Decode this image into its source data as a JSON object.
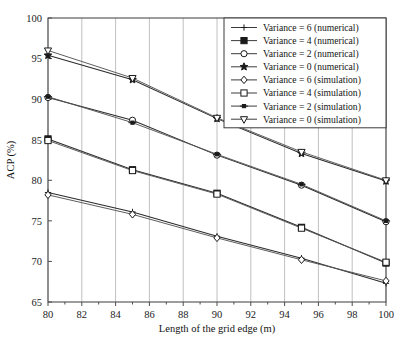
{
  "chart_data": {
    "type": "line",
    "title": "",
    "xlabel": "Length of the grid edge (m)",
    "ylabel": "ACP (%)",
    "xlim": [
      80,
      100
    ],
    "ylim": [
      65,
      100
    ],
    "xticks": [
      80,
      82,
      84,
      86,
      88,
      90,
      92,
      94,
      96,
      98,
      100
    ],
    "yticks": [
      65,
      70,
      75,
      80,
      85,
      90,
      95,
      100
    ],
    "grid": "vertical",
    "legend_position": "top-right",
    "x": [
      80,
      85,
      90,
      95,
      100
    ],
    "series": [
      {
        "name": "Variance = 6 (numerical)",
        "marker": "plus",
        "style": "solid",
        "values": [
          78.5,
          76.1,
          73.1,
          70.4,
          67.3
        ]
      },
      {
        "name": "Variance = 4 (numerical)",
        "marker": "square-solid",
        "style": "solid",
        "values": [
          85.1,
          81.3,
          78.4,
          74.2,
          69.8
        ]
      },
      {
        "name": "Variance = 2 (numerical)",
        "marker": "circle-open",
        "style": "solid",
        "values": [
          90.2,
          87.4,
          83.1,
          79.4,
          74.9
        ]
      },
      {
        "name": "Variance = 0 (numerical)",
        "marker": "star-solid",
        "style": "solid",
        "values": [
          95.4,
          92.4,
          87.6,
          83.3,
          79.9
        ]
      },
      {
        "name": "Variance = 6 (simulation)",
        "marker": "diamond-open",
        "style": "solid",
        "values": [
          78.2,
          75.8,
          72.9,
          70.2,
          67.6
        ]
      },
      {
        "name": "Variance = 4 (simulation)",
        "marker": "square-open",
        "style": "solid",
        "values": [
          84.9,
          81.2,
          78.3,
          74.1,
          69.9
        ]
      },
      {
        "name": "Variance = 2 (simulation)",
        "marker": "plus-solid",
        "style": "solid",
        "values": [
          90.3,
          87.1,
          83.2,
          79.5,
          75.0
        ]
      },
      {
        "name": "Variance = 0 (simulation)",
        "marker": "triangle-down-open",
        "style": "solid",
        "values": [
          96.0,
          92.6,
          87.7,
          83.5,
          80.0
        ]
      }
    ]
  },
  "axis": {
    "ylabel": "ACP (%)",
    "xlabel": "Length of the grid edge (m)",
    "xticklabels": [
      "80",
      "82",
      "84",
      "86",
      "88",
      "90",
      "92",
      "94",
      "96",
      "98",
      "100"
    ],
    "yticklabels": [
      "65",
      "70",
      "75",
      "80",
      "85",
      "90",
      "95",
      "100"
    ]
  },
  "legend": {
    "items": [
      {
        "label": "Variance = 6 (numerical)",
        "marker": "plus"
      },
      {
        "label": "Variance = 4 (numerical)",
        "marker": "square-solid"
      },
      {
        "label": "Variance = 2 (numerical)",
        "marker": "circle-open"
      },
      {
        "label": "Variance = 0 (numerical)",
        "marker": "star-solid"
      },
      {
        "label": "Variance = 6 (simulation)",
        "marker": "diamond-open"
      },
      {
        "label": "Variance = 4 (simulation)",
        "marker": "square-open"
      },
      {
        "label": "Variance = 2 (simulation)",
        "marker": "plus-solid"
      },
      {
        "label": "Variance = 0 (simulation)",
        "marker": "triangle-down-open"
      }
    ]
  },
  "colors": {
    "line": "#2b2b2b",
    "grid": "#b9b9b9",
    "axis": "#4d4d4d",
    "background": "#ffffff"
  }
}
